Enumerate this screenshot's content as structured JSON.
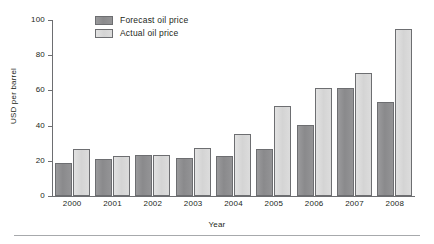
{
  "chart_data": {
    "type": "bar",
    "title": "",
    "xlabel": "Year",
    "ylabel": "USD per barrel",
    "categories": [
      "2000",
      "2001",
      "2002",
      "2003",
      "2004",
      "2005",
      "2006",
      "2007",
      "2008"
    ],
    "series": [
      {
        "name": "Forecast oil price",
        "color": "#8e8e90",
        "values": [
          19,
          21,
          23.5,
          21.5,
          22.5,
          26.5,
          40.5,
          61.5,
          53.5
        ]
      },
      {
        "name": "Actual oil price",
        "color": "#d9d9d9",
        "values": [
          26.5,
          23,
          23.5,
          27.5,
          35,
          51,
          61.5,
          70,
          95
        ]
      }
    ],
    "ylim": [
      0,
      100
    ],
    "yticks": [
      0,
      20,
      40,
      60,
      80,
      100
    ],
    "ytick_labels": [
      "0",
      "20",
      "40",
      "60",
      "80",
      "100"
    ],
    "grid": false,
    "legend_position": "top-left"
  },
  "axis": {
    "y_title": "USD per barrel",
    "x_title": "Year"
  },
  "legend": {
    "entries": [
      {
        "label": "Forecast oil price"
      },
      {
        "label": "Actual oil price"
      }
    ]
  }
}
